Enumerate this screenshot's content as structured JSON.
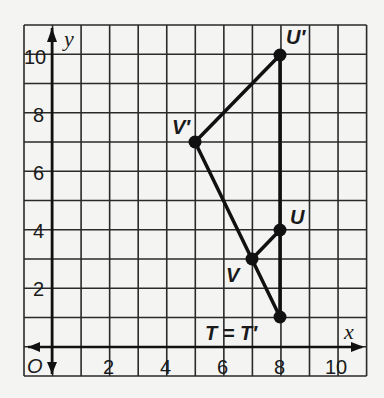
{
  "diagram": {
    "type": "coordinate-plane",
    "x_axis_label": "x",
    "y_axis_label": "y",
    "origin_label": "O",
    "x_ticks": [
      "2",
      "4",
      "6",
      "8",
      "10"
    ],
    "y_ticks": [
      "2",
      "4",
      "6",
      "8",
      "10"
    ],
    "points": [
      {
        "name": "U'",
        "x": 8,
        "y": 10
      },
      {
        "name": "V'",
        "x": 5,
        "y": 7
      },
      {
        "name": "U",
        "x": 8,
        "y": 4
      },
      {
        "name": "V",
        "x": 7,
        "y": 3
      },
      {
        "name": "T = T'",
        "x": 8,
        "y": 1
      }
    ],
    "segments": [
      [
        "T",
        "V'"
      ],
      [
        "V'",
        "U'"
      ],
      [
        "U'",
        "T"
      ],
      [
        "V",
        "U"
      ]
    ],
    "labels": {
      "u_prime": "U′",
      "v_prime": "V′",
      "u": "U",
      "v": "V",
      "t_eq": "T = T′"
    }
  }
}
